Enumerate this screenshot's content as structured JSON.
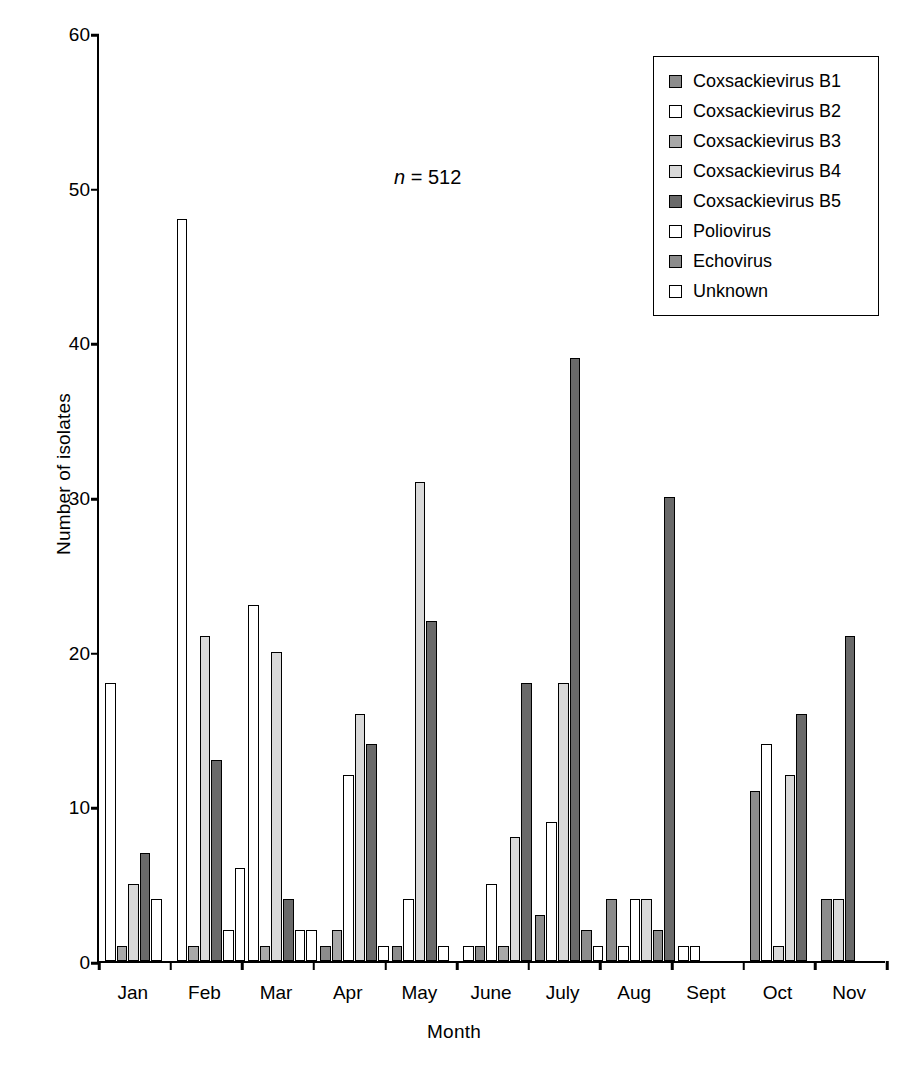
{
  "chart_data": {
    "type": "bar",
    "title": "",
    "xlabel": "Month",
    "ylabel": "Number of isolates",
    "ylim": [
      0,
      60
    ],
    "yticks": [
      0,
      10,
      20,
      30,
      40,
      50,
      60
    ],
    "grid": false,
    "legend_position": "top-right",
    "annotation": "n = 512",
    "annotation_prefix": "n",
    "annotation_suffix": " = 512",
    "categories": [
      "Jan",
      "Feb",
      "Mar",
      "Apr",
      "May",
      "June",
      "July",
      "Aug",
      "Sept",
      "Oct",
      "Nov"
    ],
    "series": [
      {
        "name": "Coxsackievirus B1",
        "color": "#8c8c8c",
        "values": [
          0,
          0,
          0,
          1,
          1,
          1,
          3,
          4,
          0,
          11,
          4
        ]
      },
      {
        "name": "Coxsackievirus B2",
        "color": "#ffffff",
        "values": [
          18,
          48,
          23,
          0,
          0,
          1,
          0,
          1,
          1,
          0,
          0
        ]
      },
      {
        "name": "Coxsackievirus B3",
        "color": "#a8a8a8",
        "values": [
          1,
          1,
          1,
          2,
          0,
          0,
          0,
          0,
          0,
          0,
          0
        ]
      },
      {
        "name": "Coxsackievirus B4",
        "color": "#d9d9d9",
        "values": [
          5,
          21,
          20,
          16,
          31,
          8,
          18,
          4,
          0,
          12,
          4
        ]
      },
      {
        "name": "Coxsackievirus B5",
        "color": "#696969",
        "values": [
          7,
          13,
          4,
          14,
          22,
          18,
          39,
          30,
          0,
          16,
          21
        ]
      },
      {
        "name": "Poliovirus",
        "color": "#ffffff",
        "values": [
          4,
          2,
          2,
          12,
          4,
          5,
          9,
          4,
          0,
          14,
          0
        ]
      },
      {
        "name": "Echovirus",
        "color": "#8c8c8c",
        "values": [
          0,
          0,
          0,
          0,
          0,
          0,
          2,
          2,
          1,
          1,
          0
        ]
      },
      {
        "name": "Unknown",
        "color": "#ffffff",
        "values": [
          0,
          6,
          0,
          1,
          1,
          0,
          1,
          0,
          0,
          0,
          0
        ]
      }
    ],
    "bars": [
      {
        "month": "Jan",
        "bars": [
          {
            "series": "Coxsackievirus B2",
            "value": 18,
            "color": "#ffffff"
          },
          {
            "series": "Coxsackievirus B3",
            "value": 1,
            "color": "#a8a8a8"
          },
          {
            "series": "Coxsackievirus B4",
            "value": 5,
            "color": "#d9d9d9"
          },
          {
            "series": "Coxsackievirus B5",
            "value": 7,
            "color": "#696969"
          },
          {
            "series": "Poliovirus",
            "value": 4,
            "color": "#ffffff"
          }
        ]
      },
      {
        "month": "Feb",
        "bars": [
          {
            "series": "Coxsackievirus B2",
            "value": 48,
            "color": "#ffffff"
          },
          {
            "series": "Coxsackievirus B3",
            "value": 1,
            "color": "#a8a8a8"
          },
          {
            "series": "Coxsackievirus B4",
            "value": 21,
            "color": "#d9d9d9"
          },
          {
            "series": "Coxsackievirus B5",
            "value": 13,
            "color": "#696969"
          },
          {
            "series": "Poliovirus",
            "value": 2,
            "color": "#ffffff"
          },
          {
            "series": "Unknown",
            "value": 6,
            "color": "#ffffff"
          }
        ]
      },
      {
        "month": "Mar",
        "bars": [
          {
            "series": "Coxsackievirus B2",
            "value": 23,
            "color": "#ffffff"
          },
          {
            "series": "Coxsackievirus B3",
            "value": 1,
            "color": "#a8a8a8"
          },
          {
            "series": "Coxsackievirus B4",
            "value": 20,
            "color": "#d9d9d9"
          },
          {
            "series": "Coxsackievirus B5",
            "value": 4,
            "color": "#696969"
          },
          {
            "series": "Poliovirus",
            "value": 2,
            "color": "#ffffff"
          },
          {
            "series": "Unknown",
            "value": 2,
            "color": "#ffffff"
          }
        ]
      },
      {
        "month": "Apr",
        "bars": [
          {
            "series": "Coxsackievirus B1",
            "value": 1,
            "color": "#8c8c8c"
          },
          {
            "series": "Coxsackievirus B3",
            "value": 2,
            "color": "#a8a8a8"
          },
          {
            "series": "Poliovirus",
            "value": 12,
            "color": "#ffffff"
          },
          {
            "series": "Coxsackievirus B4",
            "value": 16,
            "color": "#d9d9d9"
          },
          {
            "series": "Coxsackievirus B5",
            "value": 14,
            "color": "#696969"
          },
          {
            "series": "Unknown",
            "value": 1,
            "color": "#ffffff"
          }
        ]
      },
      {
        "month": "May",
        "bars": [
          {
            "series": "Coxsackievirus B1",
            "value": 1,
            "color": "#8c8c8c"
          },
          {
            "series": "Poliovirus",
            "value": 4,
            "color": "#ffffff"
          },
          {
            "series": "Coxsackievirus B4",
            "value": 31,
            "color": "#d9d9d9"
          },
          {
            "series": "Coxsackievirus B5",
            "value": 22,
            "color": "#696969"
          },
          {
            "series": "Unknown",
            "value": 1,
            "color": "#ffffff"
          }
        ]
      },
      {
        "month": "June",
        "bars": [
          {
            "series": "Coxsackievirus B2",
            "value": 1,
            "color": "#ffffff"
          },
          {
            "series": "Coxsackievirus B1",
            "value": 1,
            "color": "#8c8c8c"
          },
          {
            "series": "Poliovirus",
            "value": 5,
            "color": "#ffffff"
          },
          {
            "series": "Coxsackievirus B3",
            "value": 1,
            "color": "#a8a8a8"
          },
          {
            "series": "Coxsackievirus B4",
            "value": 8,
            "color": "#d9d9d9"
          },
          {
            "series": "Coxsackievirus B5",
            "value": 18,
            "color": "#696969"
          }
        ]
      },
      {
        "month": "July",
        "bars": [
          {
            "series": "Coxsackievirus B1",
            "value": 3,
            "color": "#8c8c8c"
          },
          {
            "series": "Poliovirus",
            "value": 9,
            "color": "#ffffff"
          },
          {
            "series": "Coxsackievirus B4",
            "value": 18,
            "color": "#d9d9d9"
          },
          {
            "series": "Coxsackievirus B5",
            "value": 39,
            "color": "#696969"
          },
          {
            "series": "Echovirus",
            "value": 2,
            "color": "#8c8c8c"
          },
          {
            "series": "Unknown",
            "value": 1,
            "color": "#ffffff"
          }
        ]
      },
      {
        "month": "Aug",
        "bars": [
          {
            "series": "Coxsackievirus B1",
            "value": 4,
            "color": "#8c8c8c"
          },
          {
            "series": "Coxsackievirus B2",
            "value": 1,
            "color": "#ffffff"
          },
          {
            "series": "Poliovirus",
            "value": 4,
            "color": "#ffffff"
          },
          {
            "series": "Coxsackievirus B4",
            "value": 4,
            "color": "#d9d9d9"
          },
          {
            "series": "Echovirus",
            "value": 2,
            "color": "#8c8c8c"
          },
          {
            "series": "Coxsackievirus B5",
            "value": 30,
            "color": "#696969"
          }
        ]
      },
      {
        "month": "Sept",
        "bars": [
          {
            "series": "Coxsackievirus B2",
            "value": 1,
            "color": "#ffffff"
          },
          {
            "series": "Echovirus",
            "value": 1,
            "color": "#ffffff"
          }
        ]
      },
      {
        "month": "Oct",
        "bars": [
          {
            "series": "Coxsackievirus B1",
            "value": 11,
            "color": "#8c8c8c"
          },
          {
            "series": "Poliovirus",
            "value": 14,
            "color": "#ffffff"
          },
          {
            "series": "Echovirus",
            "value": 1,
            "color": "#d9d9d9"
          },
          {
            "series": "Coxsackievirus B4",
            "value": 12,
            "color": "#d9d9d9"
          },
          {
            "series": "Coxsackievirus B5",
            "value": 16,
            "color": "#696969"
          }
        ]
      },
      {
        "month": "Nov",
        "bars": [
          {
            "series": "Coxsackievirus B1",
            "value": 4,
            "color": "#8c8c8c"
          },
          {
            "series": "Coxsackievirus B4",
            "value": 4,
            "color": "#d9d9d9"
          },
          {
            "series": "Coxsackievirus B5",
            "value": 21,
            "color": "#696969"
          }
        ]
      }
    ]
  },
  "legend": {
    "items": [
      {
        "label": "Coxsackievirus B1",
        "color": "#8c8c8c"
      },
      {
        "label": "Coxsackievirus B2",
        "color": "#ffffff"
      },
      {
        "label": "Coxsackievirus B3",
        "color": "#a8a8a8"
      },
      {
        "label": "Coxsackievirus B4",
        "color": "#d9d9d9"
      },
      {
        "label": "Coxsackievirus B5",
        "color": "#696969"
      },
      {
        "label": "Poliovirus",
        "color": "#ffffff"
      },
      {
        "label": "Echovirus",
        "color": "#8c8c8c"
      },
      {
        "label": "Unknown",
        "color": "#ffffff"
      }
    ]
  }
}
